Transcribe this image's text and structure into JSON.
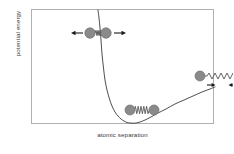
{
  "figure": {
    "type": "interatomic-potential-energy-curve",
    "background_color": "#ffffff",
    "frame_color": "#b0b0b0",
    "curve_color": "#3a3a3a",
    "atom_color": "#8a8a8a",
    "atom_edge_color": "#6e6e6e",
    "spring_color": "#555555",
    "arrow_color": "#1a1a1a"
  },
  "axes": {
    "ylabel": "potential energy",
    "xlabel": "atomic separation",
    "ticks": [],
    "gridlines": false
  },
  "annotations": [
    {
      "id": "compressed-pair",
      "description": "two atoms pressed together with outward repulsive arrows",
      "left_arrow": "←",
      "right_arrow": "→",
      "spring_state": "compressed",
      "atom_count": 2
    },
    {
      "id": "equilibrium-pair",
      "description": "two atoms at equilibrium separation joined by a relaxed spring",
      "left_arrow": "",
      "right_arrow": "",
      "spring_state": "relaxed",
      "atom_count": 2
    },
    {
      "id": "stretched-pair",
      "description": "two atoms pulled far apart with inward attractive arrows",
      "left_arrow": "→",
      "right_arrow": "←",
      "spring_state": "stretched",
      "atom_count": 2
    }
  ],
  "chart_data": {
    "type": "line",
    "title": "",
    "xlabel": "atomic separation",
    "ylabel": "potential energy",
    "grid": false,
    "legend": "none",
    "xlim": [
      0,
      183
    ],
    "ylim": [
      0,
      115
    ],
    "series": [
      {
        "name": "Lennard-Jones interatomic potential",
        "comment": "Values are plot-box pixel coordinates (x right, y down from frame top-left). Curve enters at the top of the frame on the steep repulsive wall, falls to a minimum, then rises asymptotically toward zero at large separation.",
        "points": [
          [
            66,
            0
          ],
          [
            67,
            8
          ],
          [
            68,
            18
          ],
          [
            69,
            30
          ],
          [
            70,
            44
          ],
          [
            71.5,
            58
          ],
          [
            73,
            70
          ],
          [
            75,
            80
          ],
          [
            77.5,
            89
          ],
          [
            80,
            96
          ],
          [
            83,
            102
          ],
          [
            86,
            106
          ],
          [
            89,
            109
          ],
          [
            92,
            111
          ],
          [
            95,
            112.5
          ],
          [
            98,
            113
          ],
          [
            101,
            113.2
          ],
          [
            104,
            113
          ],
          [
            108,
            112
          ],
          [
            113,
            110
          ],
          [
            119,
            107
          ],
          [
            126,
            103
          ],
          [
            134,
            99
          ],
          [
            143,
            94
          ],
          [
            152,
            90
          ],
          [
            161,
            86
          ],
          [
            170,
            82
          ],
          [
            178,
            79
          ],
          [
            183,
            77
          ]
        ]
      }
    ]
  }
}
